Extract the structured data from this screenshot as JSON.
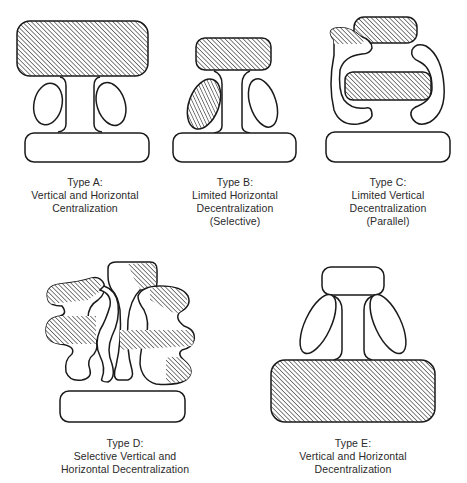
{
  "figure": {
    "hatch_color": "#1a1a1a",
    "outline_color": "#1a1a1a",
    "background": "#ffffff"
  },
  "types": [
    {
      "id": "A",
      "title": "Type A:",
      "lines": [
        "Vertical and Horizontal",
        "Centralization"
      ],
      "shaded_parts": [
        "strategic-apex"
      ]
    },
    {
      "id": "B",
      "title": "Type B:",
      "lines": [
        "Limited Horizontal",
        "Decentralization",
        "(Selective)"
      ],
      "shaded_parts": [
        "strategic-apex",
        "technostructure"
      ]
    },
    {
      "id": "C",
      "title": "Type C:",
      "lines": [
        "Limited Vertical",
        "Decentralization",
        "(Parallel)"
      ],
      "shaded_parts": [
        "strategic-apex",
        "middle-line-band",
        "technostructure-part"
      ]
    },
    {
      "id": "D",
      "title": "Type D:",
      "lines": [
        "Selective Vertical and",
        "Horizontal Decentralization"
      ],
      "shaded_parts": [
        "scattered-patches-across-all-parts"
      ]
    },
    {
      "id": "E",
      "title": "Type E:",
      "lines": [
        "Vertical and Horizontal",
        "Decentralization"
      ],
      "shaded_parts": [
        "operating-core"
      ]
    }
  ]
}
